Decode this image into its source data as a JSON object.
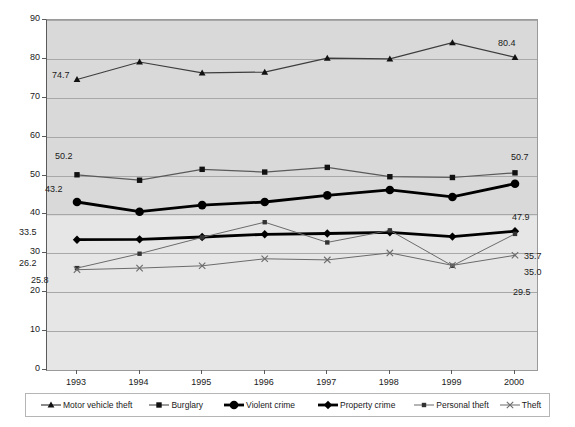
{
  "chart_data": {
    "type": "line",
    "title": "",
    "xlabel": "",
    "ylabel": "",
    "categories": [
      "1993",
      "1994",
      "1995",
      "1996",
      "1997",
      "1998",
      "1999",
      "2000"
    ],
    "ylim": [
      0,
      90
    ],
    "ytick_step": 10,
    "yticks": [
      "0",
      "10",
      "20",
      "30",
      "40",
      "50",
      "60",
      "70",
      "80",
      "90"
    ],
    "grid": true,
    "legend_position": "bottom",
    "series": [
      {
        "name": "Motor vehicle theft",
        "marker": "triangle",
        "color": "#3d3d3d",
        "width": 1.2,
        "values": [
          74.7,
          79.2,
          76.4,
          76.6,
          80.2,
          80.0,
          84.2,
          80.4
        ],
        "start_label": "74.7",
        "end_label": "80.4"
      },
      {
        "name": "Burglary",
        "marker": "square",
        "color": "#5a5a5a",
        "width": 1.2,
        "values": [
          50.2,
          48.8,
          51.6,
          50.9,
          52.1,
          49.7,
          49.5,
          50.7
        ],
        "start_label": "50.2",
        "end_label": "50.7"
      },
      {
        "name": "Violent crime",
        "marker": "circle",
        "color": "#000000",
        "width": 2.8,
        "values": [
          43.2,
          40.7,
          42.4,
          43.2,
          44.9,
          46.3,
          44.5,
          47.9
        ],
        "start_label": "43.2",
        "end_label": "47.9"
      },
      {
        "name": "Property crime",
        "marker": "diamond",
        "color": "#000000",
        "width": 2.8,
        "values": [
          33.5,
          33.6,
          34.2,
          34.9,
          35.1,
          35.4,
          34.3,
          35.7
        ],
        "start_label": "33.5",
        "end_label": "35.7"
      },
      {
        "name": "Personal theft",
        "marker": "square-small",
        "color": "#6b6b6b",
        "width": 1.0,
        "values": [
          26.2,
          29.9,
          34.1,
          38.0,
          32.8,
          35.9,
          26.8,
          35.0
        ],
        "start_label": "26.2",
        "end_label": "35.0"
      },
      {
        "name": "Theft",
        "marker": "cross",
        "color": "#6b6b6b",
        "width": 1.0,
        "values": [
          25.8,
          26.2,
          26.8,
          28.6,
          28.3,
          30.1,
          26.9,
          29.5
        ],
        "start_label": "25.8",
        "end_label": "29.5"
      }
    ]
  },
  "labels": {
    "left": [
      {
        "text": "74.7",
        "x": 52,
        "y": 70
      },
      {
        "text": "50.2",
        "x": 55,
        "y": 151
      },
      {
        "text": "43.2",
        "x": 45,
        "y": 184
      },
      {
        "text": "33.5",
        "x": 19,
        "y": 227
      },
      {
        "text": "26.2",
        "x": 19,
        "y": 258
      },
      {
        "text": "25.8",
        "x": 31,
        "y": 275
      }
    ],
    "right": [
      {
        "text": "80.4",
        "x": 498,
        "y": 38
      },
      {
        "text": "50.7",
        "x": 511,
        "y": 152
      },
      {
        "text": "47.9",
        "x": 512,
        "y": 212
      },
      {
        "text": "35.7",
        "x": 524,
        "y": 251
      },
      {
        "text": "35.0",
        "x": 524,
        "y": 267
      },
      {
        "text": "29.5",
        "x": 513,
        "y": 287
      }
    ]
  }
}
